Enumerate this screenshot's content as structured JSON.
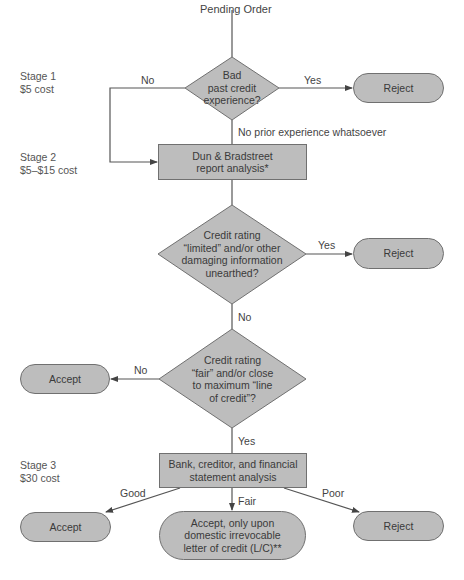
{
  "start": {
    "label": "Pending Order"
  },
  "stages": [
    {
      "name": "Stage 1",
      "cost": "$5 cost"
    },
    {
      "name": "Stage 2",
      "cost": "$5–$15 cost"
    },
    {
      "name": "Stage 3",
      "cost": "$30 cost"
    }
  ],
  "decisions": [
    {
      "lines": [
        "Bad",
        "past credit",
        "experience?"
      ]
    },
    {
      "lines": [
        "Credit rating",
        "“limited” and/or other",
        "damaging information",
        "unearthed?"
      ]
    },
    {
      "lines": [
        "Credit rating",
        "“fair” and/or close",
        "to maximum “line",
        "of credit”?"
      ]
    }
  ],
  "processes": [
    {
      "lines": [
        "Dun & Bradstreet",
        "report analysis*"
      ]
    },
    {
      "lines": [
        "Bank, creditor, and financial",
        "statement analysis"
      ]
    }
  ],
  "terminals": {
    "reject1": "Reject",
    "reject2": "Reject",
    "accept1": "Accept",
    "accept2": "Accept",
    "accept_lc": [
      "Accept, only upon",
      "domestic irrevocable",
      "letter of credit (L/C)**"
    ],
    "reject3": "Reject"
  },
  "edge_labels": {
    "d1_no": "No",
    "d1_yes": "Yes",
    "d1_none": "No prior experience whatsoever",
    "d2_yes": "Yes",
    "d2_no": "No",
    "d3_no": "No",
    "d3_yes": "Yes",
    "good": "Good",
    "fair": "Fair",
    "poor": "Poor"
  },
  "colors": {
    "fill": "#bdbdbd",
    "stroke": "#707070",
    "line": "#555555",
    "text": "#3a3a3a"
  }
}
